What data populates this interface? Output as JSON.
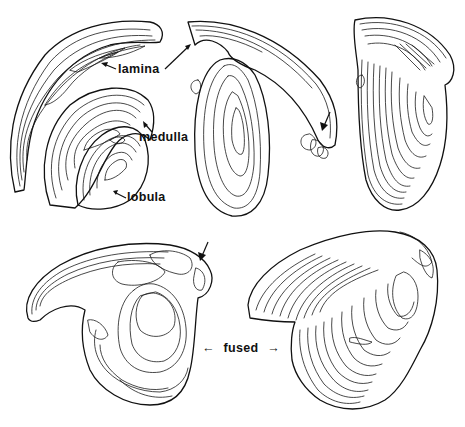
{
  "figure": {
    "labels": {
      "lamina": "lamina",
      "medulla": "medulla",
      "lobula": "lobula",
      "fused": "fused"
    },
    "arrow_glyphs": {
      "left": "←",
      "right": "→"
    },
    "panels": [
      {
        "id": "top-left",
        "content": "separated lamina, medulla and lobula with labels"
      },
      {
        "id": "top-middle",
        "content": "assembled neuropils, lateral view, arrow marker"
      },
      {
        "id": "top-right",
        "content": "stacked contour reconstruction, oblique view"
      },
      {
        "id": "bottom-left",
        "content": "assembled neuropils, arrow marker"
      },
      {
        "id": "bottom-right",
        "content": "stacked contour reconstruction, fused region"
      }
    ]
  }
}
